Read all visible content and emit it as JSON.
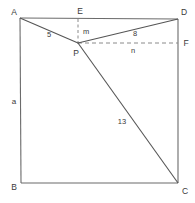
{
  "figure": {
    "width": 195,
    "height": 203,
    "background_color": "#ffffff",
    "stroke_color": "#6b6b6b",
    "dashed_stroke_color": "#8a8a8a",
    "text_color": "#3a3a3a",
    "square": {
      "name": "ABCD",
      "corners": [
        {
          "label": "A",
          "x": 20,
          "y": 18,
          "position": "top-left"
        },
        {
          "label": "D",
          "x": 178,
          "y": 19,
          "position": "top-right"
        },
        {
          "label": "C",
          "x": 178,
          "y": 183,
          "position": "bottom-right"
        },
        {
          "label": "B",
          "x": 21,
          "y": 183,
          "position": "bottom-left"
        }
      ]
    },
    "interior_point": {
      "label": "P",
      "x": 78,
      "y": 43
    },
    "edge_points": [
      {
        "label": "E",
        "x": 78,
        "y": 19,
        "on_side": "AD",
        "position": "top"
      },
      {
        "label": "F",
        "x": 178,
        "y": 43,
        "on_side": "DC",
        "position": "right"
      }
    ],
    "solid_segments": [
      {
        "name": "AP",
        "from": "A",
        "to": "P",
        "label": "5"
      },
      {
        "name": "PD",
        "from": "P",
        "to": "D",
        "label": "8"
      },
      {
        "name": "PC",
        "from": "P",
        "to": "C",
        "label": "13"
      }
    ],
    "dashed_segments": [
      {
        "name": "EP",
        "from": "E",
        "to": "P",
        "label": "m",
        "orientation": "vertical"
      },
      {
        "name": "PF",
        "from": "P",
        "to": "F",
        "label": "n",
        "orientation": "horizontal"
      }
    ],
    "side_labels": [
      {
        "name": "AB",
        "label": "a",
        "side": "left"
      }
    ],
    "labels": {
      "A": "A",
      "B": "B",
      "C": "C",
      "D": "D",
      "E": "E",
      "F": "F",
      "P": "P",
      "seg_AP": "5",
      "seg_PD": "8",
      "seg_PC": "13",
      "seg_EP": "m",
      "seg_PF": "n",
      "side_AB": "a"
    }
  }
}
